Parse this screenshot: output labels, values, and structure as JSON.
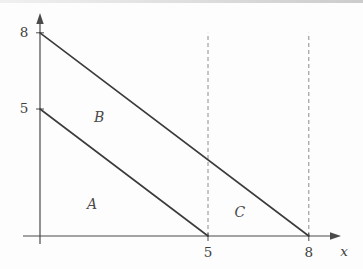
{
  "figure": {
    "colors": {
      "background": "#fdfdfd",
      "line": "#3b3b3b",
      "axis": "#4a4a4a",
      "dashed": "#8c8c8c",
      "text": "#3f3f3f"
    }
  },
  "chart_data": {
    "type": "line",
    "title": "",
    "xlabel": "x",
    "ylabel": "",
    "xlim": [
      0,
      9
    ],
    "ylim": [
      0,
      9
    ],
    "x_ticks": [
      5,
      8
    ],
    "y_ticks": [
      8,
      5
    ],
    "grid": false,
    "lines": [
      {
        "name": "upper-boundary",
        "points": [
          [
            0,
            8
          ],
          [
            8,
            0
          ]
        ],
        "style": "solid"
      },
      {
        "name": "lower-boundary",
        "points": [
          [
            0,
            5
          ],
          [
            5,
            0
          ]
        ],
        "style": "solid"
      }
    ],
    "dashed_vertical_lines": [
      {
        "x": 5,
        "y_from": 0,
        "y_to": 8
      },
      {
        "x": 8,
        "y_from": 0,
        "y_to": 8
      }
    ],
    "region_labels": [
      {
        "label": "A",
        "x": 1.55,
        "y": 1.26
      },
      {
        "label": "B",
        "x": 1.76,
        "y": 4.69
      },
      {
        "label": "C",
        "x": 5.95,
        "y": 0.94
      }
    ]
  }
}
